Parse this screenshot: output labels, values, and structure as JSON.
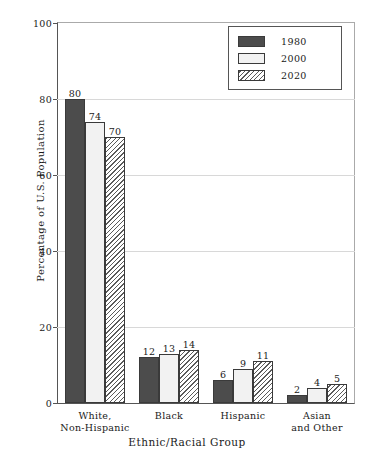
{
  "chart_data": {
    "type": "bar",
    "title": "",
    "xlabel": "Ethnic/Racial Group",
    "ylabel": "Percentage of U.S. Population",
    "categories": [
      "White,\nNon-Hispanic",
      "Black",
      "Hispanic",
      "Asian\nand Other"
    ],
    "category_lines": [
      [
        "White,",
        "Non-Hispanic"
      ],
      [
        "Black",
        ""
      ],
      [
        "Hispanic",
        ""
      ],
      [
        "Asian",
        "and Other"
      ]
    ],
    "series": [
      {
        "name": "1980",
        "values": [
          80,
          12,
          6,
          2
        ],
        "fill": "solid-dark",
        "color": "#4c4c4c"
      },
      {
        "name": "2000",
        "values": [
          74,
          13,
          9,
          4
        ],
        "fill": "dotted-light",
        "color": "#f2f2f2"
      },
      {
        "name": "2020",
        "values": [
          70,
          14,
          11,
          5
        ],
        "fill": "diagonal-hatch",
        "color": "#ffffff"
      }
    ],
    "ylim": [
      0,
      100
    ],
    "yticks": [
      0,
      20,
      40,
      60,
      80,
      100
    ],
    "ytick_labels": [
      "0",
      "20",
      "40",
      "60",
      "80",
      "100"
    ],
    "grid": true,
    "grid_axis": "y",
    "legend_position": "top-right",
    "value_labels": true
  }
}
